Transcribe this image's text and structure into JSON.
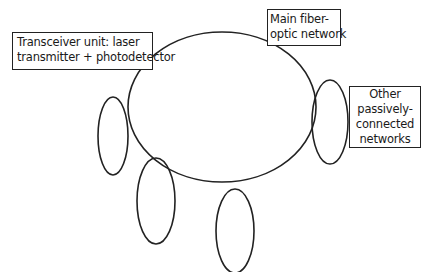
{
  "diagram": {
    "type": "network-topology",
    "labels": {
      "transceiver": {
        "lines": [
          "Transceiver unit: laser",
          "transmitter + photodetector"
        ]
      },
      "main_network": {
        "lines": [
          "Main fiber-",
          "optic network"
        ]
      },
      "other_networks": {
        "lines": [
          "Other",
          "passively-",
          "connected",
          "networks"
        ]
      }
    },
    "shapes": {
      "main_ring": {
        "cx": 222,
        "cy": 107,
        "rx": 94,
        "ry": 75
      },
      "satellites": [
        {
          "name": "left",
          "cx": 113,
          "cy": 136,
          "rx": 15,
          "ry": 39
        },
        {
          "name": "right",
          "cx": 330,
          "cy": 122,
          "rx": 18,
          "ry": 42
        },
        {
          "name": "bottom-left",
          "cx": 156,
          "cy": 201,
          "rx": 19,
          "ry": 43
        },
        {
          "name": "bottom-middle",
          "cx": 235,
          "cy": 231,
          "rx": 19,
          "ry": 42
        }
      ]
    },
    "colors": {
      "stroke": "#222222",
      "background": "#ffffff"
    }
  }
}
